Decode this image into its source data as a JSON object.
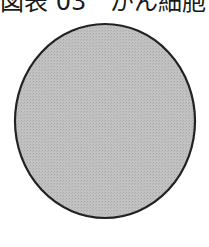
{
  "header": {
    "title": "図表 03　がん細胞と"
  },
  "figure": {
    "shape": "circle",
    "fill_color": "#bdbdbd",
    "stroke_color": "#222222"
  }
}
